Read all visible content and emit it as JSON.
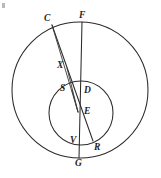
{
  "figure": {
    "background_color": "#ffffff",
    "stroke_color": "#2b2b2b",
    "width": 161,
    "height": 178
  },
  "shapes": {
    "outer_circle": {
      "name": "outer-circle",
      "cx": 80,
      "cy": 90,
      "r": 68
    },
    "inner_circle": {
      "name": "inner-circle",
      "cx": 81,
      "cy": 113,
      "r": 32
    }
  },
  "points": [
    {
      "id": "C",
      "label": "C",
      "x": 52,
      "y": 25,
      "label_x": 44,
      "label_y": 14
    },
    {
      "id": "F",
      "label": "F",
      "x": 82,
      "y": 22,
      "label_x": 79,
      "label_y": 11
    },
    {
      "id": "X",
      "label": "X",
      "x": 67,
      "y": 68,
      "label_x": 57,
      "label_y": 61
    },
    {
      "id": "S",
      "label": "S",
      "x": 72,
      "y": 90,
      "label_x": 60,
      "label_y": 84
    },
    {
      "id": "D",
      "label": "D",
      "x": 81,
      "y": 92,
      "label_x": 84,
      "label_y": 86
    },
    {
      "id": "E",
      "label": "E",
      "x": 78,
      "y": 112,
      "label_x": 84,
      "label_y": 107
    },
    {
      "id": "V",
      "label": "V",
      "x": 76,
      "y": 143,
      "label_x": 70,
      "label_y": 136
    },
    {
      "id": "R",
      "label": "R",
      "x": 93,
      "y": 141,
      "label_x": 94,
      "label_y": 143
    },
    {
      "id": "G",
      "label": "G",
      "x": 79,
      "y": 158,
      "label_x": 75,
      "label_y": 159
    }
  ],
  "segments": [
    {
      "name": "segment-C-R",
      "from": "C",
      "to": "R"
    },
    {
      "name": "segment-F-G",
      "from": "F",
      "to": "G"
    },
    {
      "name": "segment-X-E",
      "from": "X",
      "to": "E"
    },
    {
      "name": "segment-S-E",
      "from": "S",
      "to": "E"
    },
    {
      "name": "segment-C-E",
      "from": "C",
      "to": "E"
    }
  ],
  "labels": {
    "C": "C",
    "F": "F",
    "X": "X",
    "S": "S",
    "D": "D",
    "E": "E",
    "V": "V",
    "R": "R",
    "G": "G"
  }
}
